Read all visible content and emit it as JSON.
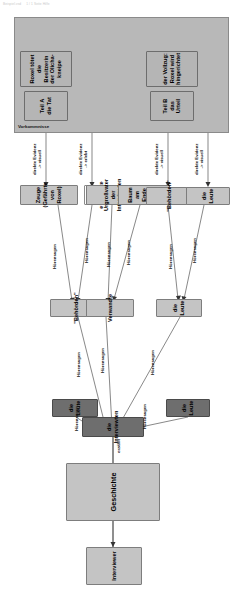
{
  "doc_header": {
    "left_text": "Beispiel.vsd",
    "right_text": "1 / 1   Seite   Hilfe"
  },
  "diagram": {
    "orientation": "rotated-90-ccw",
    "colors": {
      "node_fill": "#bdbdbd",
      "node_dark_fill": "#6e6e6e",
      "lane_fill": "#b8b8b8",
      "edge_stroke": "#555555",
      "border": "#7d7d7d"
    },
    "lane": {
      "label": "Vorkommnisse"
    },
    "nodes": [
      {
        "id": "interviewer",
        "label": "Interviewer",
        "style": "plain"
      },
      {
        "id": "geschichte",
        "label": "Geschichte",
        "style": "plain"
      },
      {
        "id": "interviewten",
        "label": "die Interviewten",
        "style": "dark"
      },
      {
        "id": "leute_links",
        "label": "die Leute",
        "style": "dark"
      },
      {
        "id": "leute_rechts",
        "label": "die Leute",
        "style": "dark"
      },
      {
        "id": "behoerden_mid",
        "label": "\"Behörden\"",
        "style": "plain"
      },
      {
        "id": "verwandte",
        "label": "Verwandte",
        "style": "plain"
      },
      {
        "id": "leute_mid",
        "label": "die Leute",
        "style": "plain"
      },
      {
        "id": "zeuge",
        "label": "Zeuge\n(Gefährte von Roxel)",
        "style": "plain"
      },
      {
        "id": "frau",
        "label": "ermordete Frau\n(Aletia)",
        "style": "white"
      },
      {
        "id": "urgrossvater",
        "label": "Urgroßvater der\nInterviewten",
        "style": "plain"
      },
      {
        "id": "baum",
        "label": "Baum\nam Ende des Pfads",
        "style": "plain"
      },
      {
        "id": "behoerden_bot",
        "label": "\"Behörden\"",
        "style": "plain"
      },
      {
        "id": "leute_bot",
        "label": "die Leute",
        "style": "plain"
      },
      {
        "id": "teil_a",
        "label": "Teil A\ndie Tat",
        "style": "story"
      },
      {
        "id": "roxel",
        "label": "Roxel tötet\ndie Besitzerin\nder Olicha-\nkneipe",
        "style": "story"
      },
      {
        "id": "teil_b",
        "label": "Teil B\ndas Urteil",
        "style": "story"
      },
      {
        "id": "vollzug",
        "label": "der Vollzug:\nRoxel wird\nhingerichtet",
        "style": "story"
      }
    ],
    "edge_labels": {
      "erzaehlt": "erzählt",
      "hoerensagen": "Hörensagen",
      "direkte_visuell": "direkte Evidenz\n-> visuell",
      "direkte_erlebt": "direkte Evidenz\n-> erlebt"
    },
    "edges": [
      {
        "from": "geschichte",
        "to": "interviewer",
        "label": ""
      },
      {
        "from": "interviewten",
        "to": "geschichte",
        "label": "erzählt"
      },
      {
        "from": "leute_links",
        "to": "interviewten",
        "label": "Hörensagen"
      },
      {
        "from": "leute_rechts",
        "to": "interviewten",
        "label": "Hörensagen"
      },
      {
        "from": "behoerden_mid",
        "to": "interviewten",
        "label": "Hörensagen"
      },
      {
        "from": "verwandte",
        "to": "interviewten",
        "label": "Hörensagen"
      },
      {
        "from": "leute_mid",
        "to": "interviewten",
        "label": "Hörensagen"
      },
      {
        "from": "zeuge",
        "to": "behoerden_mid",
        "label": "Hörensagen"
      },
      {
        "from": "frau",
        "to": "behoerden_mid",
        "label": "Hörensagen\n-> Erzählen"
      },
      {
        "from": "urgrossvater",
        "to": "verwandte",
        "label": "Hörensagen"
      },
      {
        "from": "baum",
        "to": "verwandte",
        "label": "Hörensagen"
      },
      {
        "from": "behoerden_bot",
        "to": "leute_mid",
        "label": "Hörensagen"
      },
      {
        "from": "leute_bot",
        "to": "leute_mid",
        "label": "Hörensagen"
      },
      {
        "from": "teil_a",
        "to": "zeuge",
        "label": "direkte Evidenz\n-> visuell"
      },
      {
        "from": "roxel",
        "to": "frau",
        "label": "direkte Evidenz\n-> erlebt"
      },
      {
        "from": "teil_b",
        "to": "behoerden_bot",
        "label": "direkte Evidenz\n-> visuell"
      },
      {
        "from": "vollzug",
        "to": "leute_bot",
        "label": "direkte Evidenz\n-> visuell"
      }
    ]
  }
}
